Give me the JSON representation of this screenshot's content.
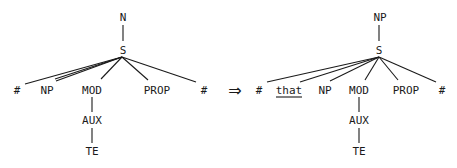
{
  "diagram": {
    "type": "syntax-tree-transformation",
    "arrow": "⇒",
    "left_tree": {
      "root": "N",
      "child": "S",
      "s_children": [
        "#",
        "NP",
        "MOD",
        "PROP",
        "#"
      ],
      "mod_chain": [
        "AUX",
        "TE"
      ]
    },
    "right_tree": {
      "root": "NP",
      "child": "S",
      "s_children": [
        "#",
        "that",
        "NP",
        "MOD",
        "PROP",
        "#"
      ],
      "underlined": "that",
      "mod_chain": [
        "AUX",
        "TE"
      ]
    }
  }
}
